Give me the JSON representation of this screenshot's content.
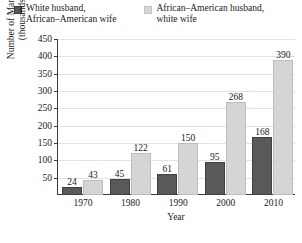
{
  "chart_data": {
    "type": "bar",
    "title": "",
    "xlabel": "Year",
    "ylabel": "Number of Marriages\n(thousands)",
    "categories": [
      "1970",
      "1980",
      "1990",
      "2000",
      "2010"
    ],
    "series": [
      {
        "name": "White husband,\nAfrican–American wife",
        "color": "#595959",
        "values": [
          24,
          45,
          61,
          95,
          168
        ]
      },
      {
        "name": "African–American husband,\nwhite wife",
        "color": "#d5d5d5",
        "values": [
          43,
          122,
          150,
          268,
          390
        ]
      }
    ],
    "ylim": [
      0,
      450
    ],
    "yticks": [
      50,
      100,
      150,
      200,
      250,
      300,
      350,
      400,
      450
    ],
    "ytick_labels": [
      "50",
      "100",
      "150",
      "200",
      "250",
      "300",
      "350",
      "400",
      "450"
    ],
    "grid": true,
    "legend_position": "top",
    "data_labels": true
  },
  "legend": {
    "entries": [
      {
        "label": "White husband,\nAfrican–American wife",
        "swatch_color": "#595959"
      },
      {
        "label": "African–American husband,\nwhite wife",
        "swatch_color": "#d5d5d5"
      }
    ]
  },
  "axes": {
    "y_title": "Number of Marriages\n(thousands)",
    "x_title": "Year"
  },
  "caption": {
    "text": ""
  }
}
